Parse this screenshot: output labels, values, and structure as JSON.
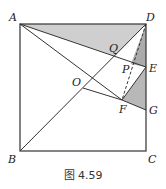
{
  "figure": {
    "caption": "图 4.59",
    "colors": {
      "line": "#333333",
      "shade_light": "#c8c8c8",
      "shade_dark": "#a8a8a8"
    },
    "points": {
      "A": {
        "label": "A",
        "x": 20,
        "y": 24
      },
      "D": {
        "label": "D",
        "x": 146,
        "y": 24
      },
      "B": {
        "label": "B",
        "x": 20,
        "y": 151
      },
      "C": {
        "label": "C",
        "x": 146,
        "y": 151
      },
      "E": {
        "label": "E",
        "x": 146,
        "y": 67
      },
      "G": {
        "label": "G",
        "x": 146,
        "y": 110
      },
      "F": {
        "label": "F",
        "x": 122,
        "y": 100
      },
      "O": {
        "label": "O",
        "x": 83,
        "y": 88
      },
      "Q": {
        "label": "Q",
        "x": 115,
        "y": 56
      },
      "P": {
        "label": "P",
        "x": 131,
        "y": 64
      }
    }
  }
}
